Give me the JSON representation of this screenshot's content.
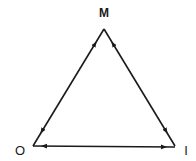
{
  "diagram": {
    "type": "triangle-relationship",
    "nodes": [
      {
        "id": "M",
        "label": "M",
        "position": "top"
      },
      {
        "id": "O",
        "label": "O",
        "position": "bottom-left"
      },
      {
        "id": "I",
        "label": "I",
        "position": "bottom-right"
      }
    ],
    "edges": [
      {
        "from": "M",
        "to": "O",
        "bidirectional": true
      },
      {
        "from": "M",
        "to": "I",
        "bidirectional": true
      },
      {
        "from": "O",
        "to": "I",
        "bidirectional": true
      }
    ],
    "colors": {
      "line": "#1a1a1a",
      "background": "#ffffff"
    }
  }
}
